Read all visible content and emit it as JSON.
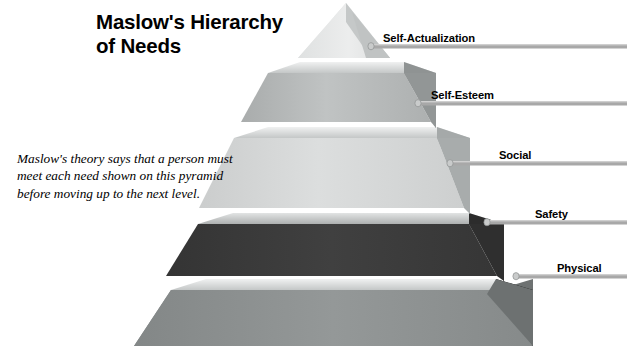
{
  "page": {
    "background_color": "#ffffff",
    "width": 627,
    "height": 354
  },
  "title": {
    "line1": "Maslow's Hierarchy",
    "line2": "of Needs",
    "full": "Maslow's Hierarchy of Needs",
    "color": "#000000"
  },
  "caption": {
    "line1": "Maslow's theory says that a person must",
    "line2": "meet each need shown on this pyramid",
    "line3": "before moving up to the next level.",
    "full": "Maslow's theory says that a person must meet each need shown on this pyramid before moving up to the next level."
  },
  "diagram": {
    "type": "pyramid",
    "style": "3d-stacked-tiers",
    "tier_count": 5,
    "leader_line_color": "#a8a8a8",
    "tiers": [
      {
        "rank": 1,
        "position": "top",
        "label": "Self-Actualization",
        "front_color": "#e9eaea",
        "side_color": "#b9bcbc",
        "slab_color": "#d6d8d8",
        "label_x": 383,
        "label_y": 32
      },
      {
        "rank": 2,
        "position": "upper-middle",
        "label": "Self-Esteem",
        "front_color": "#b8bbbb",
        "side_color": "#8e9292",
        "slab_color": "#d9dbdb",
        "label_x": 431,
        "label_y": 88
      },
      {
        "rank": 3,
        "position": "middle",
        "label": "Social",
        "front_color": "#d3d5d5",
        "side_color": "#a4a8a8",
        "slab_color": "#e4e6e6",
        "label_x": 499,
        "label_y": 143
      },
      {
        "rank": 4,
        "position": "lower-middle",
        "label": "Safety",
        "front_color": "#3b3b3b",
        "side_color": "#2b2b2b",
        "slab_color": "#c9cbcb",
        "label_x": 535,
        "label_y": 203
      },
      {
        "rank": 5,
        "position": "base",
        "label": "Physical",
        "front_color": "#8b8f8f",
        "side_color": "#6a6e6e",
        "slab_color": "#c2c5c5",
        "label_x": 557,
        "label_y": 257
      }
    ]
  }
}
